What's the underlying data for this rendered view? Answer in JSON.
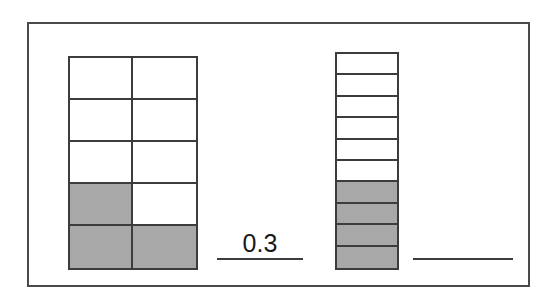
{
  "page": {
    "background_color": "#ffffff",
    "frame_color": "#4a4a4a"
  },
  "colors": {
    "shaded": "#a8a8a8",
    "unshaded": "#ffffff",
    "grid_line": "#3c3c3c",
    "text": "#1a1a1a"
  },
  "models": [
    {
      "id": "model-left",
      "name": "two-column-ten-part-model",
      "columns": 2,
      "rows": 5,
      "total_parts": 10,
      "shaded_parts": 3,
      "cells": [
        [
          "unshaded",
          "unshaded"
        ],
        [
          "unshaded",
          "unshaded"
        ],
        [
          "unshaded",
          "unshaded"
        ],
        [
          "shaded",
          "unshaded"
        ],
        [
          "shaded",
          "shaded"
        ]
      ]
    },
    {
      "id": "model-right",
      "name": "single-column-ten-part-model",
      "columns": 1,
      "rows": 10,
      "total_parts": 10,
      "shaded_parts": 4,
      "cells": [
        [
          "unshaded"
        ],
        [
          "unshaded"
        ],
        [
          "unshaded"
        ],
        [
          "unshaded"
        ],
        [
          "unshaded"
        ],
        [
          "unshaded"
        ],
        [
          "shaded"
        ],
        [
          "shaded"
        ],
        [
          "shaded"
        ],
        [
          "shaded"
        ]
      ]
    }
  ],
  "answers": [
    {
      "id": "answer-left",
      "name": "answer-blank-left",
      "value": "0.3",
      "filled": true
    },
    {
      "id": "answer-right",
      "name": "answer-blank-right",
      "value": "",
      "filled": false
    }
  ]
}
